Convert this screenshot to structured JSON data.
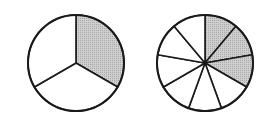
{
  "diagram": {
    "colors": {
      "stroke": "#1a1a1a",
      "shaded": "#c4c4c4",
      "unshaded": "#ffffff"
    },
    "circles": [
      {
        "name": "thirds-circle",
        "cx": 76,
        "cy": 63,
        "r": 48,
        "slices": 3,
        "shaded": 1
      },
      {
        "name": "ninths-circle",
        "cx": 205,
        "cy": 63,
        "r": 48,
        "slices": 9,
        "shaded": 3
      }
    ]
  }
}
